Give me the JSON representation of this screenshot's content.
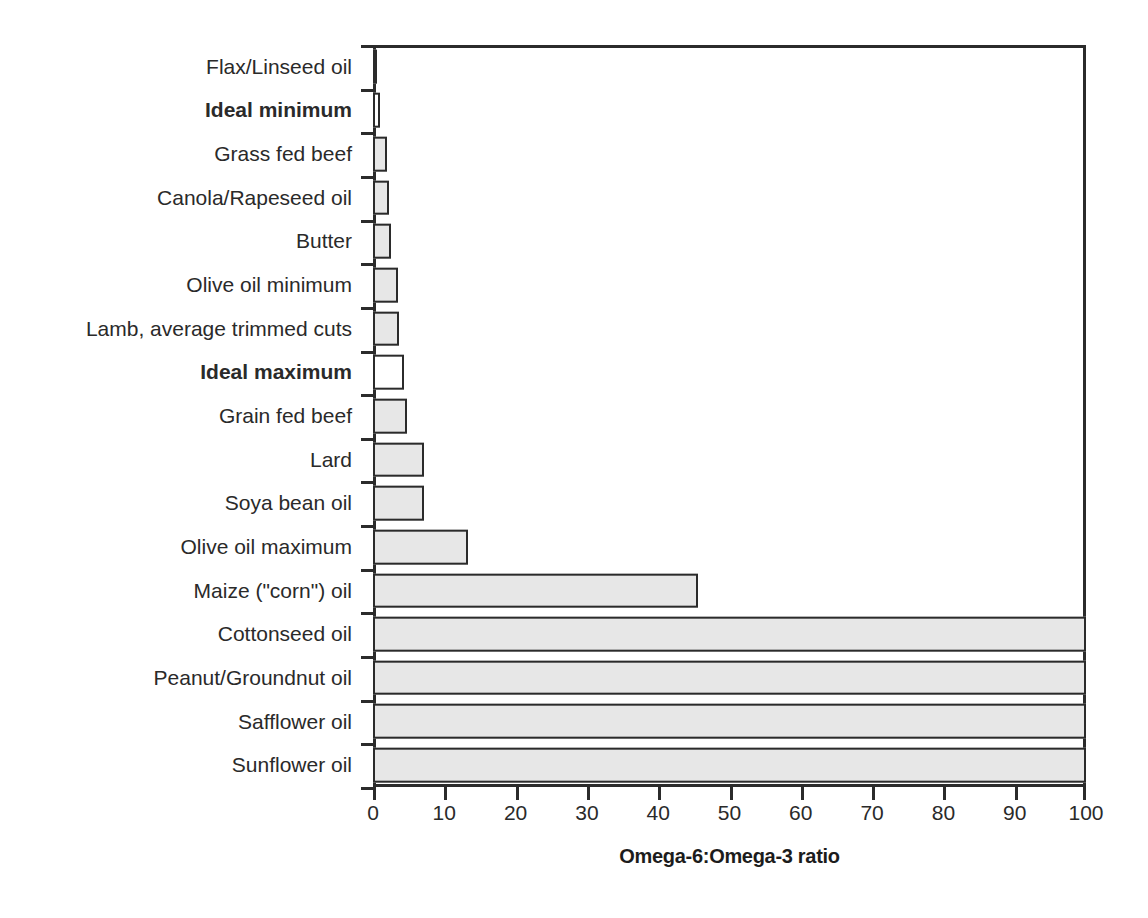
{
  "chart_data": {
    "type": "bar",
    "orientation": "horizontal",
    "title": "",
    "xlabel": "Omega-6:Omega-3 ratio",
    "ylabel": "",
    "xlim": [
      0,
      100
    ],
    "xticks": [
      0,
      10,
      20,
      30,
      40,
      50,
      60,
      70,
      80,
      90,
      100
    ],
    "xtick_labels": [
      "0",
      "10",
      "20",
      "30",
      "40",
      "50",
      "60",
      "70",
      "80",
      "90",
      "100"
    ],
    "grid": false,
    "legend": false,
    "bar_fill_color": "#e7e7e7",
    "bar_fill_color_highlight": "#ffffff",
    "bar_edge_color": "#2b2b2b",
    "categories": [
      "Flax/Linseed oil",
      "Ideal minimum",
      "Grass fed beef",
      "Canola/Rapeseed oil",
      "Butter",
      "Olive oil minimum",
      "Lamb, average trimmed cuts",
      "Ideal maximum",
      "Grain fed beef",
      "Lard",
      "Soya bean oil",
      "Olive oil maximum",
      "Maize (\"corn\") oil",
      "Cottonseed oil",
      "Peanut/Groundnut oil",
      "Safflower oil",
      "Sunflower oil"
    ],
    "values": [
      0.3,
      1,
      2,
      2.2,
      2.5,
      3.5,
      3.7,
      4.3,
      4.8,
      7.2,
      7.2,
      13.3,
      45.6,
      100,
      100,
      100,
      100
    ],
    "emphasis": [
      false,
      true,
      false,
      false,
      false,
      false,
      false,
      true,
      false,
      false,
      false,
      false,
      false,
      false,
      false,
      false,
      false
    ],
    "unfilled": [
      false,
      true,
      false,
      false,
      false,
      false,
      false,
      true,
      false,
      false,
      false,
      false,
      false,
      false,
      false,
      false,
      false
    ]
  }
}
